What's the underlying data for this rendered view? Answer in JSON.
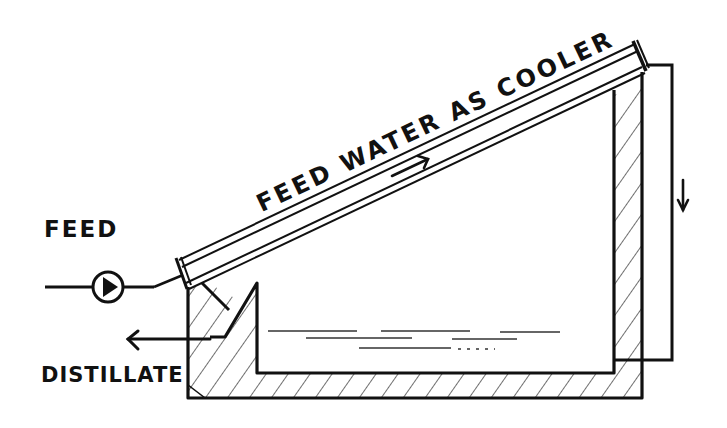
{
  "diagram": {
    "title_hint": "Solar still with feed water as cooler",
    "labels": {
      "feed": "FEED",
      "distillate": "DISTILLATE",
      "cooler": "FEED WATER AS COOLER"
    },
    "components": [
      {
        "name": "feed-pump",
        "description": "Circular pump symbol on feed inlet line"
      },
      {
        "name": "glass-cover",
        "description": "Inclined double-pane cover cooled by feed water flowing upward"
      },
      {
        "name": "return-pipe",
        "description": "Vertical return line on the right carrying water down into the basin"
      },
      {
        "name": "basin",
        "description": "Insulated hatched basin holding saline water"
      },
      {
        "name": "distillate-trough",
        "description": "Collection channel at lower-left, distillate exits leftward"
      }
    ],
    "flow_arrows": [
      {
        "name": "cover-flow-arrow",
        "direction": "up-right along cover"
      },
      {
        "name": "return-flow-arrow",
        "direction": "down"
      },
      {
        "name": "distillate-outlet-arrow",
        "direction": "left"
      }
    ],
    "colors": {
      "ink": "#111111",
      "background": "#ffffff"
    }
  }
}
